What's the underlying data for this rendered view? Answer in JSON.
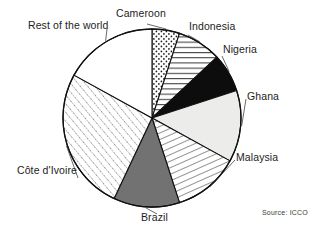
{
  "figure": {
    "background_color": "#ffffff",
    "source_text": "Source: ICCO"
  },
  "chart_data": {
    "type": "pie",
    "title": "",
    "subtitle": "",
    "xlabel": "",
    "ylabel": "",
    "legend_position": "none",
    "labels_position": "outside-callout",
    "grid": false,
    "start_angle_deg": 0,
    "direction": "clockwise",
    "units": "percent share",
    "categories": [
      "Cameroon",
      "Indonesia",
      "Nigeria",
      "Ghana",
      "Malaysia",
      "Brazil",
      "Côte d'Ivoire",
      "Rest of the world"
    ],
    "values": [
      5,
      8,
      7,
      13,
      12,
      12,
      26,
      17
    ],
    "slices": [
      {
        "label": "Cameroon",
        "value": 5,
        "start_deg": 0,
        "end_deg": 18,
        "fill_style": "dotted",
        "fill_color": "#ffffff",
        "pattern_color": "#1a1a1a",
        "stroke": "#111111"
      },
      {
        "label": "Indonesia",
        "value": 8,
        "start_deg": 18,
        "end_deg": 46.8,
        "fill_style": "horizontal-lines",
        "fill_color": "#ffffff",
        "pattern_color": "#1a1a1a",
        "stroke": "#111111"
      },
      {
        "label": "Nigeria",
        "value": 7,
        "start_deg": 46.8,
        "end_deg": 72,
        "fill_style": "solid",
        "fill_color": "#0d0d0d",
        "pattern_color": "#0d0d0d",
        "stroke": "#111111"
      },
      {
        "label": "Ghana",
        "value": 13,
        "start_deg": 72,
        "end_deg": 118.8,
        "fill_style": "light-solid",
        "fill_color": "#ececeb",
        "pattern_color": "#ececeb",
        "stroke": "#111111"
      },
      {
        "label": "Malaysia",
        "value": 12,
        "start_deg": 118.8,
        "end_deg": 162,
        "fill_style": "diagonal-lines",
        "fill_color": "#ffffff",
        "pattern_color": "#1a1a1a",
        "stroke": "#111111"
      },
      {
        "label": "Brazil",
        "value": 12,
        "start_deg": 162,
        "end_deg": 205.2,
        "fill_style": "mid-gray-solid",
        "fill_color": "#727272",
        "pattern_color": "#727272",
        "stroke": "#111111"
      },
      {
        "label": "Côte d'Ivoire",
        "value": 26,
        "start_deg": 205.2,
        "end_deg": 298.8,
        "fill_style": "dotted-diagonal",
        "fill_color": "#ffffff",
        "pattern_color": "#1a1a1a",
        "stroke": "#111111"
      },
      {
        "label": "Rest of the world",
        "value": 17,
        "start_deg": 298.8,
        "end_deg": 360,
        "fill_style": "empty",
        "fill_color": "#ffffff",
        "pattern_color": "#ffffff",
        "stroke": "#111111"
      }
    ],
    "geometry": {
      "center_x": 152,
      "center_y": 118,
      "radius": 89
    }
  },
  "labels": {
    "rest_of_the_world": "Rest of the world",
    "cameroon": "Cameroon",
    "indonesia": "Indonesia",
    "nigeria": "Nigeria",
    "ghana": "Ghana",
    "malaysia": "Malaysia",
    "brazil": "Brazil",
    "cote_divoire": "Côte d'Ivoire"
  }
}
